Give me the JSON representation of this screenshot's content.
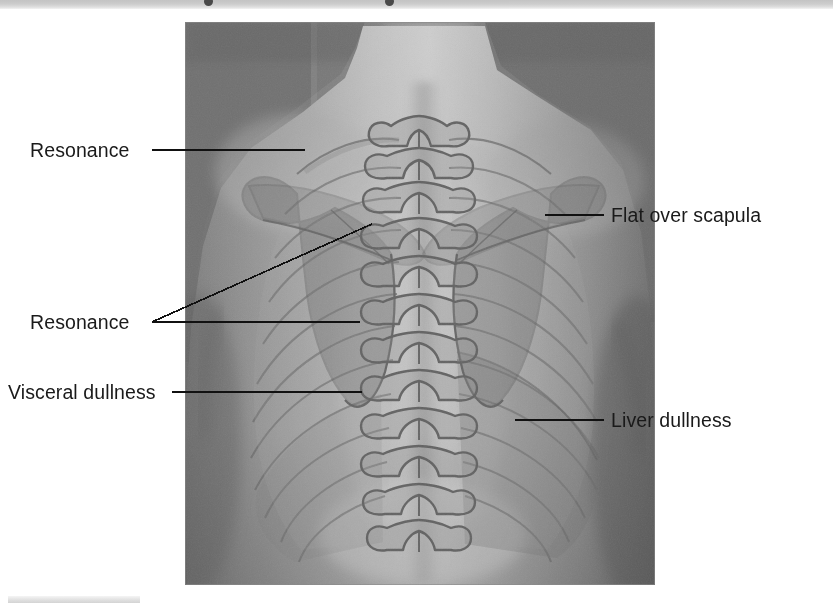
{
  "figure": {
    "top_strip_note": "cut-off caption text above figure",
    "bottom_bar_note": "cut-off element below figure"
  },
  "image": {
    "alt": "Grayscale photograph of a person's bare upper back with semi-transparent anatomical overlay of vertebral column, ribs, and scapulae",
    "type": "photograph-with-anatomical-overlay"
  },
  "labels": [
    {
      "id": "resonance-upper",
      "text": "Resonance",
      "side": "left",
      "leader": "horizontal",
      "region": "upper lung field"
    },
    {
      "id": "resonance-lower",
      "text": "Resonance",
      "side": "left",
      "leader": "forked",
      "region": "lower lung field"
    },
    {
      "id": "visceral-dullness",
      "text": "Visceral dullness",
      "side": "left",
      "leader": "horizontal",
      "region": "left lower posterior thorax"
    },
    {
      "id": "flat-over-scapula",
      "text": "Flat over scapula",
      "side": "right",
      "leader": "horizontal",
      "region": "scapula"
    },
    {
      "id": "liver-dullness",
      "text": "Liver dullness",
      "side": "right",
      "leader": "horizontal",
      "region": "right lower posterior thorax"
    }
  ],
  "colors": {
    "label_text": "#1a1a1a",
    "leader_line": "#111111",
    "photo_background": "#8d8d8d",
    "overlay_stroke": "#6e6e6e",
    "scapula_fill": "#7d7d7d",
    "liver_fill": "#8a8a8a",
    "page_background": "#ffffff"
  }
}
